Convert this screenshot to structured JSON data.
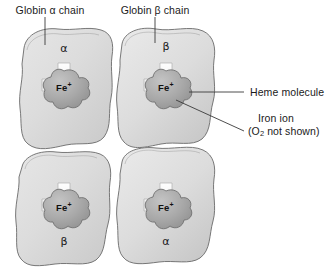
{
  "figure": {
    "background_color": "#ffffff",
    "line_color": "#555555",
    "text_color": "#1a1a1a",
    "subunit_fill": "#dedede",
    "heme_fill": "#a8a8a8",
    "cross_fill": "#f5f5f5"
  },
  "callouts": {
    "globin_alpha": "Globin α chain",
    "globin_beta": "Globin β chain",
    "heme": "Heme molecule",
    "iron_ion_line1": "Iron ion",
    "iron_ion_line2_pre": "(O",
    "iron_ion_line2_sub": "2",
    "iron_ion_line2_post": " not shown)"
  },
  "subunits": [
    {
      "id": "top-left",
      "chain_label": "α",
      "iron_label": "Fe",
      "iron_charge": "+"
    },
    {
      "id": "top-right",
      "chain_label": "β",
      "iron_label": "Fe",
      "iron_charge": "+"
    },
    {
      "id": "bottom-left",
      "chain_label": "β",
      "iron_label": "Fe",
      "iron_charge": "+"
    },
    {
      "id": "bottom-right",
      "chain_label": "α",
      "iron_label": "Fe",
      "iron_charge": "+"
    }
  ]
}
